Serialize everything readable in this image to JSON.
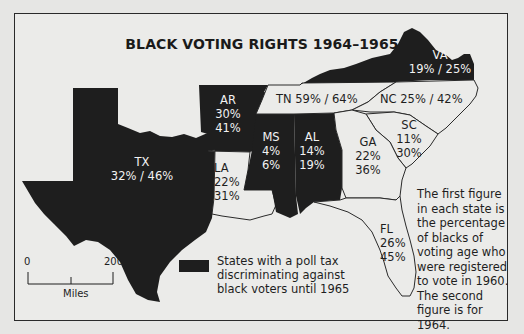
{
  "title": "BLACK VOTING RIGHTS 1964–1965",
  "colors": {
    "poll_tax_state": "#1e1e1e",
    "other_state": "#ebebe9",
    "background": "#e6e6e4",
    "border": "#2a2a2a"
  },
  "states": {
    "tx": {
      "abbr": "TX",
      "pct_1960": "32%",
      "pct_1964": "46%",
      "line2": "32% / 46%",
      "poll_tax": true
    },
    "ar": {
      "abbr": "AR",
      "pct_1960": "30%",
      "pct_1964": "41%",
      "poll_tax": true
    },
    "la": {
      "abbr": "LA",
      "pct_1960": "22%",
      "pct_1964": "31%",
      "poll_tax": false
    },
    "ms": {
      "abbr": "MS",
      "pct_1960": "4%",
      "pct_1964": "6%",
      "poll_tax": true
    },
    "al": {
      "abbr": "AL",
      "pct_1960": "14%",
      "pct_1964": "19%",
      "poll_tax": true
    },
    "tn": {
      "abbr": "TN",
      "label": "TN 59% / 64%",
      "pct_1960": "59%",
      "pct_1964": "64%",
      "poll_tax": false
    },
    "nc": {
      "abbr": "NC",
      "label": "NC 25% / 42%",
      "pct_1960": "25%",
      "pct_1964": "42%",
      "poll_tax": false
    },
    "va": {
      "abbr": "VA",
      "pct_1960": "19%",
      "pct_1964": "25%",
      "line2": "19% / 25%",
      "poll_tax": true
    },
    "ga": {
      "abbr": "GA",
      "pct_1960": "22%",
      "pct_1964": "36%",
      "poll_tax": false
    },
    "sc": {
      "abbr": "SC",
      "pct_1960": "11%",
      "pct_1964": "30%",
      "poll_tax": false
    },
    "fl": {
      "abbr": "FL",
      "pct_1960": "26%",
      "pct_1964": "45%",
      "poll_tax": false
    }
  },
  "legend": {
    "text": "States with a poll tax discriminating against black voters until 1965"
  },
  "note": "The first figure in each state is the percentage of blacks of voting age who were registered to vote in 1960. The second figure is for 1964.",
  "scale": {
    "min": "0",
    "max": "200",
    "unit": "Miles"
  }
}
